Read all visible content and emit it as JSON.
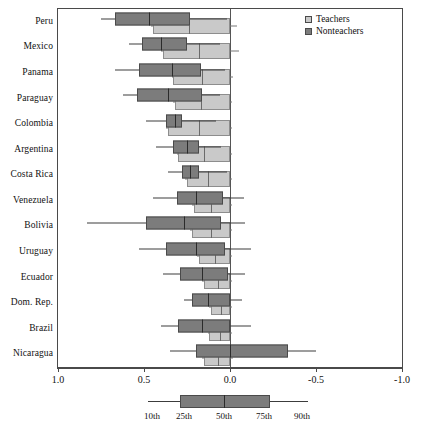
{
  "chart_data": {
    "type": "boxplot",
    "title": "",
    "xlabel": "",
    "ylabel": "",
    "xlim": [
      1.0,
      -1.0
    ],
    "xtick_labels": [
      "1.0",
      "0.5",
      "0.0",
      "-0.5",
      "-1.0"
    ],
    "xtick_values": [
      1.0,
      0.5,
      0.0,
      -0.5,
      -1.0
    ],
    "axis_reversed": true,
    "grid": false,
    "legend_position": "top-right",
    "legend": [
      {
        "label": "Teachers",
        "color": "#c9c9c9"
      },
      {
        "label": "Nonteachers",
        "color": "#7c7c7c"
      }
    ],
    "percentile_key": {
      "labels": [
        "10th",
        "25th",
        "50th",
        "75th",
        "90th"
      ],
      "caption": ""
    },
    "categories": [
      "Peru",
      "Mexico",
      "Panama",
      "Paraguay",
      "Colombia",
      "Argentina",
      "Costa Rica",
      "Venezuela",
      "Bolivia",
      "Uruguay",
      "Ecuador",
      "Dom. Rep.",
      "Brazil",
      "Nicaragua"
    ],
    "series": [
      {
        "name": "Teachers",
        "color": "#c9c9c9",
        "boxes": [
          {
            "category": "Peru",
            "p10": 0.46,
            "p25": 0.45,
            "p50": 0.24,
            "p75": 0.0,
            "p90": -0.04
          },
          {
            "category": "Mexico",
            "p10": 0.4,
            "p25": 0.39,
            "p50": 0.18,
            "p75": 0.0,
            "p90": -0.05
          },
          {
            "category": "Panama",
            "p10": 0.34,
            "p25": 0.33,
            "p50": 0.16,
            "p75": 0.0,
            "p90": -0.02
          },
          {
            "category": "Paraguay",
            "p10": 0.33,
            "p25": 0.32,
            "p50": 0.17,
            "p75": 0.0,
            "p90": -0.01
          },
          {
            "category": "Colombia",
            "p10": 0.37,
            "p25": 0.36,
            "p50": 0.18,
            "p75": 0.0,
            "p90": -0.01
          },
          {
            "category": "Argentina",
            "p10": 0.31,
            "p25": 0.3,
            "p50": 0.15,
            "p75": 0.0,
            "p90": -0.01
          },
          {
            "category": "Costa Rica",
            "p10": 0.26,
            "p25": 0.25,
            "p50": 0.13,
            "p75": 0.0,
            "p90": -0.01
          },
          {
            "category": "Venezuela",
            "p10": 0.22,
            "p25": 0.21,
            "p50": 0.11,
            "p75": 0.0,
            "p90": -0.01
          },
          {
            "category": "Bolivia",
            "p10": 0.23,
            "p25": 0.22,
            "p50": 0.11,
            "p75": 0.0,
            "p90": -0.01
          },
          {
            "category": "Uruguay",
            "p10": 0.19,
            "p25": 0.18,
            "p50": 0.09,
            "p75": 0.0,
            "p90": -0.01
          },
          {
            "category": "Ecuador",
            "p10": 0.16,
            "p25": 0.15,
            "p50": 0.07,
            "p75": 0.0,
            "p90": -0.01
          },
          {
            "category": "Dom. Rep.",
            "p10": 0.12,
            "p25": 0.11,
            "p50": 0.05,
            "p75": 0.0,
            "p90": -0.01
          },
          {
            "category": "Brazil",
            "p10": 0.13,
            "p25": 0.12,
            "p50": 0.06,
            "p75": 0.0,
            "p90": -0.01
          },
          {
            "category": "Nicaragua",
            "p10": 0.16,
            "p25": 0.15,
            "p50": 0.07,
            "p75": 0.0,
            "p90": -0.02
          }
        ]
      },
      {
        "name": "Nonteachers",
        "color": "#7c7c7c",
        "boxes": [
          {
            "category": "Peru",
            "p10": 0.75,
            "p25": 0.67,
            "p50": 0.47,
            "p75": 0.23,
            "p90": 0.02
          },
          {
            "category": "Mexico",
            "p10": 0.59,
            "p25": 0.51,
            "p50": 0.4,
            "p75": 0.25,
            "p90": 0.06
          },
          {
            "category": "Panama",
            "p10": 0.67,
            "p25": 0.53,
            "p50": 0.34,
            "p75": 0.17,
            "p90": 0.03
          },
          {
            "category": "Paraguay",
            "p10": 0.62,
            "p25": 0.54,
            "p50": 0.36,
            "p75": 0.16,
            "p90": 0.06
          },
          {
            "category": "Colombia",
            "p10": 0.49,
            "p25": 0.37,
            "p50": 0.32,
            "p75": 0.28,
            "p90": 0.08
          },
          {
            "category": "Argentina",
            "p10": 0.43,
            "p25": 0.33,
            "p50": 0.25,
            "p75": 0.18,
            "p90": 0.05
          },
          {
            "category": "Costa Rica",
            "p10": 0.36,
            "p25": 0.28,
            "p50": 0.23,
            "p75": 0.18,
            "p90": 0.02
          },
          {
            "category": "Venezuela",
            "p10": 0.45,
            "p25": 0.31,
            "p50": 0.2,
            "p75": 0.04,
            "p90": -0.08
          },
          {
            "category": "Bolivia",
            "p10": 0.83,
            "p25": 0.49,
            "p50": 0.27,
            "p75": 0.05,
            "p90": -0.09
          },
          {
            "category": "Uruguay",
            "p10": 0.53,
            "p25": 0.37,
            "p50": 0.2,
            "p75": 0.03,
            "p90": -0.12
          },
          {
            "category": "Ecuador",
            "p10": 0.39,
            "p25": 0.29,
            "p50": 0.16,
            "p75": 0.01,
            "p90": -0.09
          },
          {
            "category": "Dom. Rep.",
            "p10": 0.27,
            "p25": 0.22,
            "p50": 0.13,
            "p75": 0.0,
            "p90": -0.07
          },
          {
            "category": "Brazil",
            "p10": 0.4,
            "p25": 0.3,
            "p50": 0.16,
            "p75": 0.0,
            "p90": -0.12
          },
          {
            "category": "Nicaragua",
            "p10": 0.35,
            "p25": 0.2,
            "p50": 0.0,
            "p75": -0.34,
            "p90": -0.5
          }
        ]
      }
    ]
  }
}
